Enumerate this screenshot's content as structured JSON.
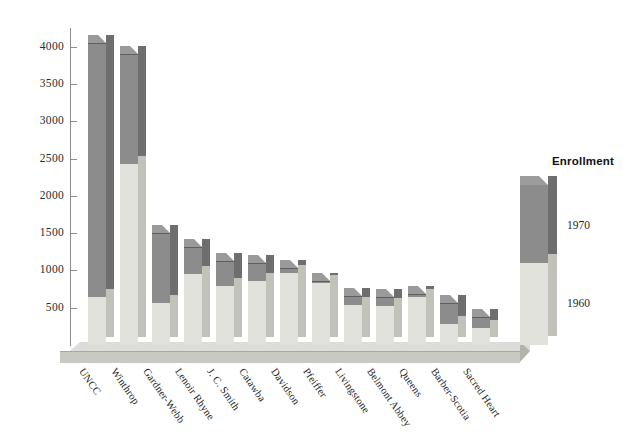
{
  "chart_data": {
    "type": "bar",
    "title": "",
    "subtitle": "",
    "xlabel": "",
    "ylabel": "",
    "ylim": [
      0,
      4250
    ],
    "grid": false,
    "stacked": true,
    "style": "3d-stacked-column",
    "legend_position": "right",
    "legend_title": "Enrollment",
    "categories": [
      "UNCC",
      "Winthrop",
      "Gardner-Webb",
      "Lenoir Rhyne",
      "J. C. Smith",
      "Catawba",
      "Davidson",
      "Pfeiffer",
      "Livingstone",
      "Belmont Abbey",
      "Queens",
      "Barber-Scotia",
      "Sacred Heart"
    ],
    "series": [
      {
        "name": "1960",
        "color": "#e2e2dc",
        "values": [
          650,
          2430,
          560,
          950,
          790,
          860,
          960,
          830,
          530,
          520,
          650,
          280,
          230
        ]
      },
      {
        "name": "1970",
        "color": "#8c8c8c",
        "values": [
          3400,
          1470,
          940,
          370,
          330,
          240,
          70,
          30,
          130,
          120,
          30,
          280,
          150
        ]
      }
    ],
    "totals": [
      4050,
      3900,
      1500,
      1320,
      1120,
      1100,
      1030,
      860,
      660,
      640,
      680,
      560,
      380
    ],
    "yticks": [
      500,
      1000,
      1500,
      2000,
      2500,
      3000,
      3500,
      4000
    ],
    "ytick_labels": [
      "500",
      "1000",
      "1500",
      "2000",
      "2500",
      "3000",
      "3500",
      "4000"
    ]
  },
  "legend": {
    "title": "Enrollment",
    "items": [
      {
        "label": "1970",
        "color": "#8c8c8c"
      },
      {
        "label": "1960",
        "color": "#e2e2dc"
      }
    ]
  },
  "colors": {
    "bar_1970_face": "#8c8c8c",
    "bar_1970_side": "#6e6e6e",
    "bar_1960_face": "#e2e2dc",
    "bar_1960_side": "#c2c2bb",
    "plinth": "#dcdcd8",
    "axis": "#8d8d8d",
    "text": "#1f1f1f",
    "background": "#ffffff"
  }
}
